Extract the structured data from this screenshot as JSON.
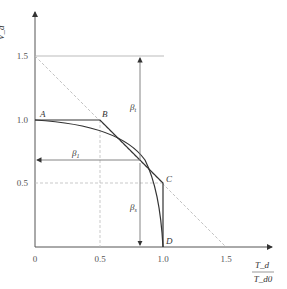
{
  "axes": {
    "y_label_num": "V_d",
    "y_label_den": "V_d0",
    "x_label_num": "T_d",
    "x_label_den": "T_d0",
    "x_ticks": [
      "0",
      "0.5",
      "1.0",
      "1.5"
    ],
    "y_ticks": [
      "0.5",
      "1.0",
      "1.5"
    ]
  },
  "points": {
    "A": "A",
    "B": "B",
    "C": "C",
    "D": "D"
  },
  "betas": {
    "t": "β",
    "t_sub": "t",
    "s": "β",
    "s_sub": "s",
    "one": "β",
    "one_sub": "1"
  },
  "colors": {
    "line": "#333333",
    "guide": "#aaaaaa",
    "dashed": "#bbbbbb"
  }
}
